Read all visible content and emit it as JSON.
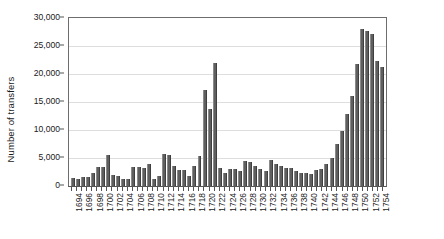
{
  "chart_data": {
    "type": "bar",
    "title": "",
    "xlabel": "",
    "ylabel": "Number of transfers",
    "ylim": [
      0,
      30000
    ],
    "ytick_values": [
      0,
      5000,
      10000,
      15000,
      20000,
      25000,
      30000
    ],
    "ytick_labels": [
      "0",
      "5,000",
      "10,000",
      "15,000",
      "20,000",
      "25,000",
      "30,000"
    ],
    "grid": "horizontal",
    "legend": "none",
    "bar_color": "#5f5f5f",
    "categories": [
      1694,
      1695,
      1696,
      1697,
      1698,
      1699,
      1700,
      1701,
      1702,
      1703,
      1704,
      1705,
      1706,
      1707,
      1708,
      1709,
      1710,
      1711,
      1712,
      1713,
      1714,
      1715,
      1716,
      1717,
      1718,
      1719,
      1720,
      1721,
      1722,
      1723,
      1724,
      1725,
      1726,
      1727,
      1728,
      1729,
      1730,
      1731,
      1732,
      1733,
      1734,
      1735,
      1736,
      1737,
      1738,
      1739,
      1740,
      1741,
      1742,
      1743,
      1744,
      1745,
      1746,
      1747,
      1748,
      1749,
      1750,
      1751,
      1752,
      1753,
      1754,
      1755
    ],
    "xtick_labels": [
      "1694",
      "1696",
      "1698",
      "1700",
      "1702",
      "1704",
      "1706",
      "1708",
      "1710",
      "1712",
      "1714",
      "1716",
      "1718",
      "1720",
      "1722",
      "1724",
      "1726",
      "1728",
      "1730",
      "1732",
      "1734",
      "1736",
      "1738",
      "1740",
      "1742",
      "1744",
      "1746",
      "1748",
      "1750",
      "1752",
      "1754"
    ],
    "values": [
      1400,
      1200,
      1550,
      1600,
      2300,
      3400,
      3400,
      5500,
      1900,
      1700,
      1200,
      1200,
      3400,
      3400,
      3300,
      3900,
      1200,
      1800,
      5800,
      5500,
      3600,
      2800,
      2900,
      1800,
      3500,
      5300,
      17200,
      13800,
      21900,
      3300,
      2400,
      3000,
      3000,
      2700,
      4400,
      4300,
      3500,
      3000,
      2700,
      4600,
      3900,
      3500,
      3300,
      3200,
      2600,
      2400,
      2400,
      2200,
      2900,
      3100,
      4000,
      5000,
      7500,
      9800,
      12800,
      16000,
      21700,
      28100,
      27700,
      27200,
      22400,
      21200
    ]
  }
}
